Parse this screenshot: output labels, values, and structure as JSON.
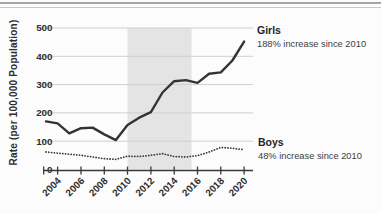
{
  "chart_data": {
    "type": "line",
    "title": "",
    "xlabel": "",
    "ylabel": "Rate (per 100,000 Population)",
    "x": [
      2003,
      2004,
      2005,
      2006,
      2007,
      2008,
      2009,
      2010,
      2011,
      2012,
      2013,
      2014,
      2015,
      2016,
      2017,
      2018,
      2019,
      2020
    ],
    "x_ticks": [
      2004,
      2006,
      2008,
      2010,
      2012,
      2014,
      2016,
      2018,
      2020
    ],
    "ylim": [
      0,
      500
    ],
    "y_ticks": [
      0,
      100,
      200,
      300,
      400,
      500
    ],
    "grid": "horizontal-light",
    "legend_position": "right-annotations",
    "highlight_band": {
      "from": 2010,
      "to": 2015.5,
      "color": "#e4e4e4"
    },
    "series": [
      {
        "name": "Girls",
        "annotation": "188% increase since 2010",
        "line_style": "solid",
        "color": "#343434",
        "values": [
          170,
          163,
          128,
          146,
          148,
          124,
          104,
          157,
          183,
          203,
          272,
          312,
          316,
          306,
          338,
          343,
          385,
          452
        ]
      },
      {
        "name": "Boys",
        "annotation": "48% increase since 2010",
        "line_style": "dotted",
        "color": "#3d3d3d",
        "values": [
          62,
          58,
          54,
          50,
          44,
          38,
          36,
          47,
          46,
          50,
          56,
          46,
          44,
          49,
          62,
          78,
          75,
          70
        ]
      }
    ]
  },
  "colors": {
    "grid": "#cfcfcf",
    "axis": "#3a3a3a",
    "tick_text": "#2f2f2f",
    "band": "#e4e4e4",
    "rule_dark": "#a5a5a5",
    "rule_light": "#c9c9c9"
  }
}
